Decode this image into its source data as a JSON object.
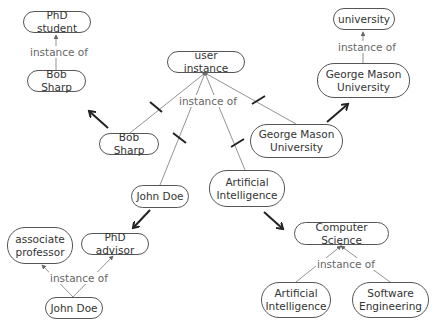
{
  "nodes": {
    "phd_student": "PhD student",
    "bob_sharp_top": "Bob Sharp",
    "user_instance": "user instance",
    "university": "university",
    "gmu_top": "George Mason\nUniversity",
    "bob_sharp_mid": "Bob Sharp",
    "gmu_mid": "George Mason\nUniversity",
    "john_doe_mid": "John Doe",
    "ai_mid": "Artificial\nIntelligence",
    "assoc_prof": "associate\nprofessor",
    "phd_advisor": "PhD advisor",
    "john_doe_bottom": "John Doe",
    "computer_science": "Computer Science",
    "ai_bottom": "Artificial\nIntelligence",
    "software_eng": "Software\nEngineering"
  },
  "edge_labels": {
    "top_left": "instance of",
    "center": "instance of",
    "top_right": "instance of",
    "bottom_left": "instance of",
    "bottom_right": "instance of"
  },
  "colors": {
    "thin_edge": "#777777",
    "thick_arrow": "#222222",
    "node_border": "#555555",
    "label_text": "#666666"
  }
}
